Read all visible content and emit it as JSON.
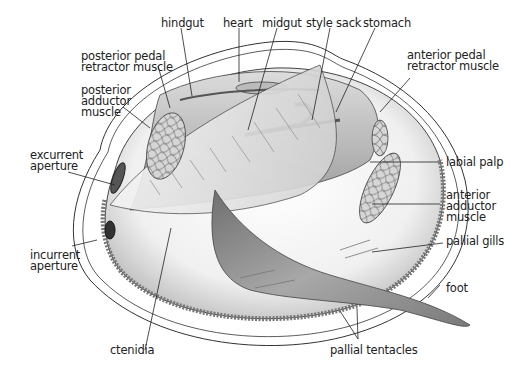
{
  "labels": {
    "hindgut": "hindgut",
    "heart": "heart",
    "midgut": "midgut",
    "style_sack": "style sack",
    "stomach": "stomach",
    "posterior_pedal_retractor": "posterior pedal\nretractor muscle",
    "posterior_adductor": "posterior\nadductor\nmuscle",
    "anterior_pedal_retractor": "anterior pedal\nretractor muscle",
    "excurrent_aperture": "excurrent\naperture",
    "labial_palp": "labial palp",
    "anterior_adductor": "anterior\nadductor\nmuscle",
    "pallial_gills": "pallial gills",
    "incurrent_aperture": "incurrent\naperture",
    "foot": "foot",
    "ctenidia": "ctenidia",
    "pallial_tentacles": "pallial tentacles"
  },
  "colors": {
    "outline": "#333333",
    "shell_fill": "#f2f2f2",
    "body_dark": "#8a8a8a",
    "body_light": "#e6e6e6",
    "muscle_fill": "#cfcfcf"
  }
}
